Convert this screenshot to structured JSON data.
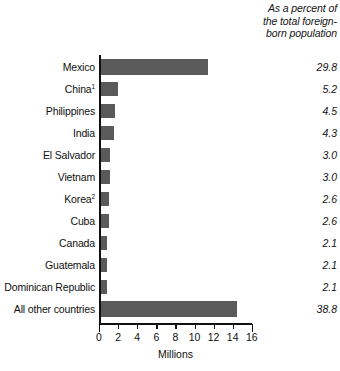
{
  "header": {
    "pct_col_line1": "As a percent of",
    "pct_col_line2": "the total foreign-",
    "pct_col_line3": "born population"
  },
  "axis": {
    "title": "Millions",
    "ticks": [
      "0",
      "2",
      "4",
      "6",
      "8",
      "10",
      "12",
      "14",
      "16"
    ]
  },
  "chart_data": {
    "type": "bar",
    "orientation": "horizontal",
    "title": "",
    "xlabel": "Millions",
    "ylabel": "",
    "xlim": [
      0,
      16
    ],
    "xticks": [
      0,
      2,
      4,
      6,
      8,
      10,
      12,
      14,
      16
    ],
    "grid": false,
    "legend": null,
    "bar_color": "#5a5a5a",
    "categories": [
      "Mexico",
      "China",
      "Philippines",
      "India",
      "El Salvador",
      "Vietnam",
      "Korea",
      "Cuba",
      "Canada",
      "Guatemala",
      "Dominican Republic",
      "All other countries"
    ],
    "category_footnotes": [
      "",
      "1",
      "",
      "",
      "",
      "",
      "2",
      "",
      "",
      "",
      "",
      ""
    ],
    "values": [
      11.4,
      2.0,
      1.7,
      1.6,
      1.1,
      1.1,
      1.0,
      1.0,
      0.8,
      0.8,
      0.8,
      14.4
    ],
    "series": [
      {
        "name": "Foreign-born population (millions)",
        "values": [
          11.4,
          2.0,
          1.7,
          1.6,
          1.1,
          1.1,
          1.0,
          1.0,
          0.8,
          0.8,
          0.8,
          14.4
        ]
      }
    ],
    "percent_label_header": "As a percent of the total foreign-born population",
    "percent_values": [
      "29.8",
      "5.2",
      "4.5",
      "4.3",
      "3.0",
      "3.0",
      "2.6",
      "2.6",
      "2.1",
      "2.1",
      "2.1",
      "38.8"
    ]
  },
  "rows": [
    {
      "label": "Mexico",
      "sup": "",
      "value": 11.4,
      "pct": "29.8"
    },
    {
      "label": "China",
      "sup": "1",
      "value": 2.0,
      "pct": "5.2"
    },
    {
      "label": "Philippines",
      "sup": "",
      "value": 1.7,
      "pct": "4.5"
    },
    {
      "label": "India",
      "sup": "",
      "value": 1.6,
      "pct": "4.3"
    },
    {
      "label": "El Salvador",
      "sup": "",
      "value": 1.1,
      "pct": "3.0"
    },
    {
      "label": "Vietnam",
      "sup": "",
      "value": 1.1,
      "pct": "3.0"
    },
    {
      "label": "Korea",
      "sup": "2",
      "value": 1.0,
      "pct": "2.6"
    },
    {
      "label": "Cuba",
      "sup": "",
      "value": 1.0,
      "pct": "2.6"
    },
    {
      "label": "Canada",
      "sup": "",
      "value": 0.8,
      "pct": "2.1"
    },
    {
      "label": "Guatemala",
      "sup": "",
      "value": 0.8,
      "pct": "2.1"
    },
    {
      "label": "Dominican Republic",
      "sup": "",
      "value": 0.8,
      "pct": "2.1"
    },
    {
      "label": "All other countries",
      "sup": "",
      "value": 14.4,
      "pct": "38.8"
    }
  ]
}
